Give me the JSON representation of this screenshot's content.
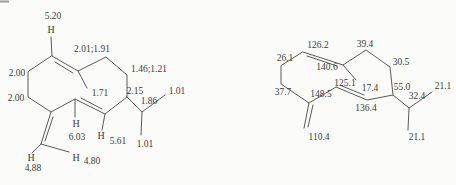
{
  "colors": {
    "background": "#fbfbf9",
    "line": "#5a5a58",
    "text": "#3c3c3a"
  },
  "proton_structure": {
    "h_atom": "H",
    "shifts": {
      "olefinic_ch_top": "5.20",
      "ring_ch2_top": "2.01;1.91",
      "ring_ch2_left_upper": "2.00",
      "ring_ch2_left_lower": "2.00",
      "ring_ch2_right": "1.46;1.21",
      "vinyl_methyl": "1.71",
      "ring_ch_isopropyl": "2.15",
      "isopropyl_ch": "1.86",
      "isopropyl_ch3_upper": "1.01",
      "isopropyl_ch3_lower": "1.01",
      "diene_ch_left": "6.03",
      "diene_ch_right": "5.61",
      "exomethylene_h_left": "4.88",
      "exomethylene_h_right": "4.80"
    }
  },
  "carbon_structure": {
    "shifts": {
      "olefinic_ch_top": "126.2",
      "ring_ch2_top": "39.4",
      "ring_ch2_left_upper": "26.1",
      "olefinic_c_quaternary": "140.6",
      "ring_ch2_right": "30.5",
      "diene_ch_left": "125.1",
      "vinyl_methyl": "17.4",
      "ring_ch_isopropyl": "55.0",
      "isopropyl_ch3_upper": "21.1",
      "ring_ch2_left_lower": "37.7",
      "exomethylene_c": "148.5",
      "isopropyl_ch": "32.4",
      "diene_ch_right": "136.4",
      "exomethylene_ch2": "110.4",
      "isopropyl_ch3_lower": "21.1"
    }
  }
}
